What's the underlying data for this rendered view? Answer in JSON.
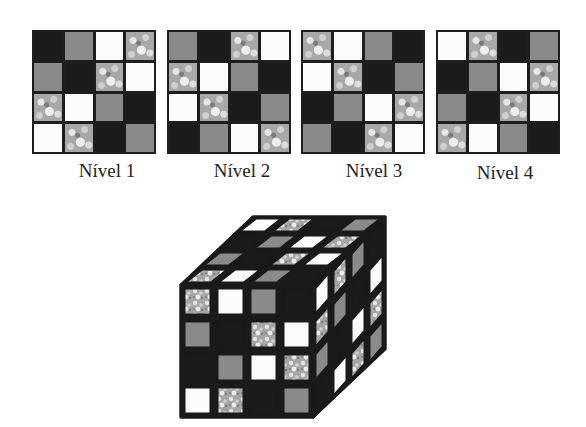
{
  "legend": {
    "b": "black",
    "g": "gray",
    "w": "white",
    "t": "textured"
  },
  "levels": [
    {
      "label": "Nível 1",
      "cells": [
        [
          "b",
          "g",
          "w",
          "t"
        ],
        [
          "g",
          "b",
          "t",
          "w"
        ],
        [
          "t",
          "w",
          "g",
          "b"
        ],
        [
          "w",
          "t",
          "b",
          "g"
        ]
      ]
    },
    {
      "label": "Nível 2",
      "cells": [
        [
          "g",
          "b",
          "t",
          "w"
        ],
        [
          "t",
          "w",
          "g",
          "b"
        ],
        [
          "w",
          "t",
          "b",
          "g"
        ],
        [
          "b",
          "g",
          "w",
          "t"
        ]
      ]
    },
    {
      "label": "Nível 3",
      "cells": [
        [
          "t",
          "w",
          "g",
          "b"
        ],
        [
          "w",
          "t",
          "b",
          "g"
        ],
        [
          "b",
          "g",
          "w",
          "t"
        ],
        [
          "g",
          "b",
          "t",
          "w"
        ]
      ]
    },
    {
      "label": "Nível 4",
      "cells": [
        [
          "w",
          "t",
          "b",
          "g"
        ],
        [
          "b",
          "g",
          "w",
          "t"
        ],
        [
          "g",
          "b",
          "t",
          "w"
        ],
        [
          "t",
          "w",
          "g",
          "b"
        ]
      ]
    }
  ],
  "cube": {
    "front_face": [
      [
        "t",
        "w",
        "g",
        "b"
      ],
      [
        "g",
        "b",
        "t",
        "w"
      ],
      [
        "b",
        "g",
        "w",
        "t"
      ],
      [
        "w",
        "t",
        "b",
        "g"
      ]
    ]
  }
}
